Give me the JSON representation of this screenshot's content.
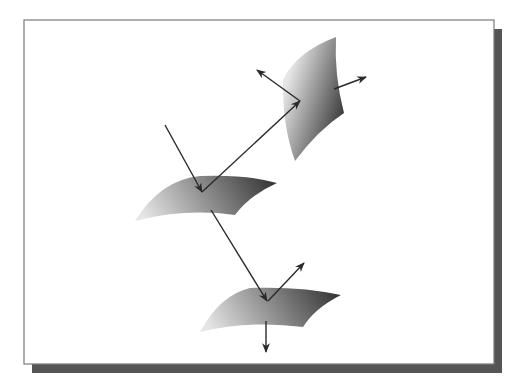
{
  "diagram": {
    "title": "",
    "colors": {
      "background": "#ffffff",
      "frame_border": "#7a7a7a",
      "frame_fill": "#ffffff",
      "shadow": "#555555",
      "ray": "#2a2a2a",
      "surface_light": "#e6e6e6",
      "surface_dark": "#3a3a3a"
    },
    "frame": {
      "x": 24,
      "y": 20,
      "width": 470,
      "height": 344
    },
    "shadow": {
      "offset_x": 8,
      "offset_y": 9
    },
    "surfaces": [
      {
        "id": "surface-upper-right",
        "path": "M 336 37 Q 296 52 283 80 Q 282 125 295 161 Q 318 130 344 113 Q 334 75 336 37 Z",
        "gradient": {
          "x1": 0.1,
          "y1": 0.3,
          "x2": 0.9,
          "y2": 0.8
        }
      },
      {
        "id": "surface-middle",
        "path": "M 135 221 Q 160 180 200 176 Q 245 174 277 183 Q 250 195 235 215 Q 185 208 135 221 Z",
        "gradient": {
          "x1": 0.0,
          "y1": 0.6,
          "x2": 1.0,
          "y2": 0.4
        }
      },
      {
        "id": "surface-lower",
        "path": "M 200 332 Q 220 295 250 288 Q 300 286 341 295 Q 315 308 303 327 Q 250 320 200 332 Z",
        "gradient": {
          "x1": 0.0,
          "y1": 0.6,
          "x2": 1.0,
          "y2": 0.4
        }
      }
    ],
    "rays": [
      {
        "id": "incident-ray",
        "x1": 165,
        "y1": 125,
        "x2": 202,
        "y2": 192,
        "arrow": true
      },
      {
        "id": "reflected-ray-to-upper-surface",
        "x1": 202,
        "y1": 192,
        "x2": 300,
        "y2": 101,
        "arrow": true
      },
      {
        "id": "transmitted-ray-to-lower-surface",
        "x1": 211,
        "y1": 210,
        "x2": 267,
        "y2": 301,
        "arrow": true
      },
      {
        "id": "upper-surface-reflection",
        "x1": 300,
        "y1": 101,
        "x2": 257,
        "y2": 70,
        "arrow": true
      },
      {
        "id": "upper-surface-transmission",
        "x1": 334,
        "y1": 89,
        "x2": 366,
        "y2": 77,
        "arrow": true
      },
      {
        "id": "lower-surface-reflection",
        "x1": 268,
        "y1": 301,
        "x2": 304,
        "y2": 263,
        "arrow": true
      },
      {
        "id": "lower-surface-transmission",
        "x1": 266,
        "y1": 321,
        "x2": 266,
        "y2": 352,
        "arrow": true
      }
    ]
  }
}
